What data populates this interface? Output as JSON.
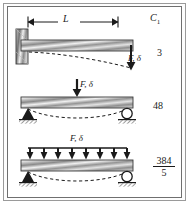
{
  "figure": {
    "column_header": "C",
    "column_header_sub": "1",
    "span_label": "L",
    "frame_color": "#6f6f6f",
    "beam_color_light": "#fafafa",
    "beam_color_dark": "#8c8c8c",
    "ink_color": "#1a1a1a"
  },
  "cases": [
    {
      "id": "cantilever-end-load",
      "name": "Cantilever with concentrated end load",
      "load_label": "F, δ",
      "load_type": "point",
      "support_left": "fixed-wall",
      "support_right": "free",
      "constant": "3",
      "constant_is_fraction": false
    },
    {
      "id": "simple-center-load",
      "name": "Simply supported with center point load",
      "load_label": "F, δ",
      "load_type": "point",
      "support_left": "pin",
      "support_right": "roller",
      "constant": "48",
      "constant_is_fraction": false
    },
    {
      "id": "simple-uniform-load",
      "name": "Simply supported with uniformly distributed load",
      "load_label": "F, δ",
      "load_type": "distributed",
      "arrow_count": "8",
      "support_left": "pin",
      "support_right": "roller",
      "constant_numerator": "384",
      "constant_denominator": "5",
      "constant_is_fraction": true
    }
  ]
}
